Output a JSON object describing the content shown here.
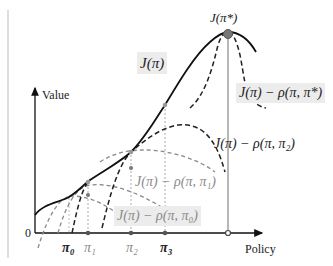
{
  "diagram": {
    "axes": {
      "y_label": "Value",
      "x_label": "Policy",
      "origin_label": "0"
    },
    "curves": {
      "objective": {
        "label": "J(π)",
        "style": "solid",
        "color": "#111111"
      },
      "optimum": {
        "label": "J(π*)",
        "marker_color": "#777777"
      },
      "surrogate_star": {
        "label": "J(π) − ρ(π, π*)",
        "style": "dashed",
        "color": "#222222"
      },
      "surrogate_2": {
        "label": "J(π) − ρ(π, π₂)",
        "style": "dashed",
        "color": "#222222"
      },
      "surrogate_1": {
        "label": "J(π) − ρ(π, π₁)",
        "style": "dashed",
        "color": "#888888"
      },
      "surrogate_0": {
        "label": "J(π) − ρ(π, π₀)",
        "style": "dashed",
        "color": "#888888"
      }
    },
    "x_ticks": [
      {
        "label": "π₀",
        "emphasis": "bold"
      },
      {
        "label": "π₁",
        "emphasis": "grey"
      },
      {
        "label": "π₂",
        "emphasis": "grey"
      },
      {
        "label": "π₃",
        "emphasis": "bold"
      }
    ],
    "colors": {
      "label_box": "#ececec",
      "solid_curve": "#111111",
      "grey_dashed": "#8a8a8a",
      "guide_line": "#999999"
    }
  }
}
